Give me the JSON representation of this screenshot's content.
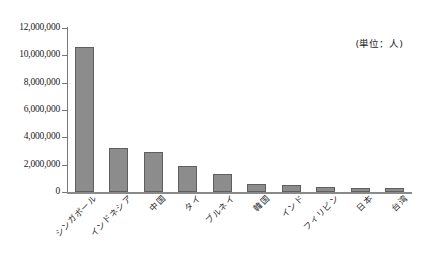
{
  "chart_data": {
    "type": "bar",
    "title": "",
    "subtitle": "",
    "xlabel": "",
    "ylabel": "",
    "unit_note": "(単位：人)",
    "ylim": [
      0,
      12000000
    ],
    "ytick_labels": [
      "12,000,000",
      "10,000,000",
      "8,000,000",
      "6,000,000",
      "4,000,000",
      "2,000,000",
      "0"
    ],
    "ytick_values": [
      12000000,
      10000000,
      8000000,
      6000000,
      4000000,
      2000000,
      0
    ],
    "grid": false,
    "legend": false,
    "categories": [
      "シンガポール",
      "インドネシア",
      "中国",
      "タイ",
      "ブルネイ",
      "韓国",
      "インド",
      "フィリピン",
      "日本",
      "台湾"
    ],
    "values": [
      10600000,
      3250000,
      2900000,
      1880000,
      1350000,
      560000,
      510000,
      350000,
      330000,
      300000
    ],
    "bar_color": "#8c8c8c",
    "bar_border_color": "#5f5f5f",
    "axis_color": "#808080",
    "background_color": "#ffffff"
  }
}
